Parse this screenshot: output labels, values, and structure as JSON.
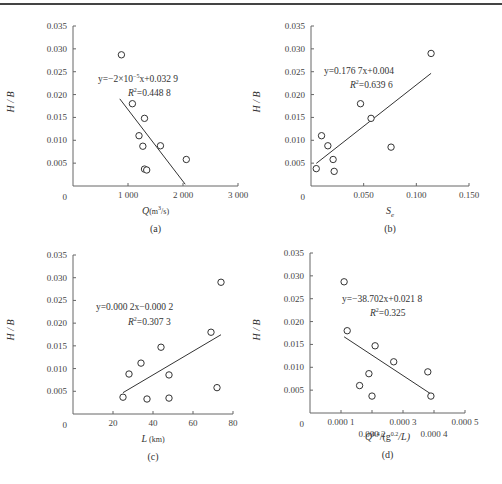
{
  "chart_data": [
    {
      "panel": "(a)",
      "type": "scatter",
      "xlabel": "Q(m³/s)",
      "ylabel": "H / B",
      "xlim": [
        0,
        3000
      ],
      "ylim": [
        0,
        0.035
      ],
      "xticks": [
        "0",
        "1 000",
        "2 000",
        "3 000"
      ],
      "yticks": [
        "0",
        "0.005",
        "0.010",
        "0.015",
        "0.020",
        "0.025",
        "0.030",
        "0.035"
      ],
      "x": [
        880,
        1080,
        1200,
        1270,
        1300,
        1300,
        1340,
        1590,
        2060
      ],
      "y": [
        0.0287,
        0.018,
        0.011,
        0.0087,
        0.0148,
        0.0037,
        0.0035,
        0.0088,
        0.0058
      ],
      "trendline": {
        "equation": "y=−2×10⁻⁵x+0.032 9",
        "r2": "R²=0.448 8",
        "x_range": [
          850,
          2040
        ]
      },
      "grid": false
    },
    {
      "panel": "(b)",
      "type": "scatter",
      "xlabel": "Sₑ",
      "ylabel": "H / B",
      "xlim": [
        0,
        0.15
      ],
      "ylim": [
        0,
        0.035
      ],
      "xticks": [
        "0",
        "0.050",
        "0.100",
        "0.150"
      ],
      "yticks": [
        "0",
        "0.005",
        "0.010",
        "0.015",
        "0.020",
        "0.025",
        "0.030",
        "0.035"
      ],
      "x": [
        0.005,
        0.01,
        0.016,
        0.021,
        0.022,
        0.047,
        0.057,
        0.076,
        0.114
      ],
      "y": [
        0.0038,
        0.011,
        0.0088,
        0.0058,
        0.0032,
        0.018,
        0.0148,
        0.0085,
        0.029
      ],
      "trendline": {
        "equation": "y=0.176 7x+0.004",
        "r2": "R²=0.639 6",
        "x_range": [
          0.005,
          0.114
        ]
      },
      "grid": false
    },
    {
      "panel": "(c)",
      "type": "scatter",
      "xlabel": "L(km)",
      "ylabel": "H / B",
      "xlim": [
        0,
        80
      ],
      "ylim": [
        0,
        0.035
      ],
      "xticks": [
        "0",
        "20",
        "40",
        "60",
        "80"
      ],
      "yticks": [
        "0",
        "0.005",
        "0.010",
        "0.015",
        "0.020",
        "0.025",
        "0.030",
        "0.035"
      ],
      "x": [
        25,
        28,
        34,
        37,
        44,
        48,
        48,
        69,
        72,
        74
      ],
      "y": [
        0.0037,
        0.0088,
        0.0112,
        0.0033,
        0.0147,
        0.0086,
        0.0035,
        0.018,
        0.0058,
        0.029
      ],
      "trendline": {
        "equation": "y=0.000 2x−0.000 2",
        "r2": "R²=0.307 3",
        "x_range": [
          25,
          74
        ]
      },
      "grid": false
    },
    {
      "panel": "(d)",
      "type": "scatter",
      "xlabel": "Q^0.4/(g^0.2/L)",
      "ylabel": "H / B",
      "xlim": [
        0,
        0.0005
      ],
      "ylim": [
        0,
        0.035
      ],
      "xticks": [
        "0",
        "0.000 1",
        "0.000 2",
        "0.000 3",
        "0.000 4",
        "0.000 5"
      ],
      "yticks": [
        "0",
        "0.005",
        "0.010",
        "0.015",
        "0.020",
        "0.025",
        "0.030",
        "0.035"
      ],
      "x": [
        0.00011,
        0.00012,
        0.00016,
        0.00019,
        0.0002,
        0.00021,
        0.00027,
        0.00038,
        0.00039
      ],
      "y": [
        0.0287,
        0.018,
        0.006,
        0.0086,
        0.0037,
        0.0147,
        0.0112,
        0.009,
        0.0037
      ],
      "trendline": {
        "equation": "y=−38.702x+0.021 8",
        "r2": "R²=0.325",
        "x_range": [
          0.00011,
          0.00039
        ]
      },
      "grid": false
    }
  ],
  "panels": {
    "a": {
      "caption": "(a)",
      "eq": "y=−2×10",
      "eq_exp": "−5",
      "eq_rest": "x+0.032 9",
      "r2_label": "R",
      "r2_val": "=0.448 8",
      "xlabel_main": "Q",
      "xlabel_unit": "(m",
      "xlabel_exp": "3",
      "xlabel_tail": "/s)"
    },
    "b": {
      "caption": "(b)",
      "eq": "y=0.176 7x+0.004",
      "r2_label": "R",
      "r2_val": "=0.639 6",
      "xlabel_main": "S",
      "xlabel_sub": "e"
    },
    "c": {
      "caption": "(c)",
      "eq": "y=0.000 2x−0.000 2",
      "r2_label": "R",
      "r2_val": "=0.307 3",
      "xlabel_main": "L",
      "xlabel_unit": "(km)"
    },
    "d": {
      "caption": "(d)",
      "eq": "y=−38.702x+0.021 8",
      "r2_label": "R",
      "r2_val": "=0.325",
      "xlabel_q": "Q",
      "xlabel_e1": "0.4",
      "xlabel_mid": "/(g",
      "xlabel_e2": "0.2",
      "xlabel_tail": "/L)"
    }
  },
  "ylabel": "H / B",
  "zero": "0"
}
